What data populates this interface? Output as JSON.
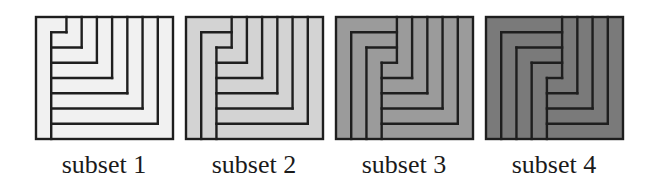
{
  "figure": {
    "panels": [
      {
        "label": "subset 1",
        "gamma_count": 1,
        "fill": "#f1f1f1",
        "x": 36
      },
      {
        "label": "subset 2",
        "gamma_count": 2,
        "fill": "#d3d3d3",
        "x": 186
      },
      {
        "label": "subset 3",
        "gamma_count": 3,
        "fill": "#9b9b9b",
        "x": 336
      },
      {
        "label": "subset 4",
        "gamma_count": 4,
        "fill": "#7a7a7a",
        "x": 486
      }
    ],
    "box": {
      "y": 17,
      "width": 137,
      "height": 122,
      "cols": 9,
      "rows": 8
    },
    "stroke": "#1e1e1e",
    "stroke_width": 2.4
  }
}
